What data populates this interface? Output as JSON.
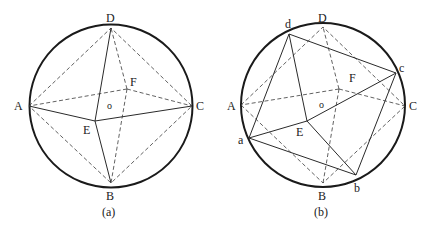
{
  "figures": [
    {
      "id": "a",
      "caption": "(a)",
      "labels": {
        "A": "A",
        "B": "B",
        "C": "C",
        "D": "D",
        "E": "E",
        "F": "F",
        "o": "o"
      }
    },
    {
      "id": "b",
      "caption": "(b)",
      "labels": {
        "A": "A",
        "B": "B",
        "C": "C",
        "D": "D",
        "E": "E",
        "F": "F",
        "o": "o",
        "a": "a",
        "b": "b",
        "c": "c",
        "d": "d"
      }
    }
  ]
}
